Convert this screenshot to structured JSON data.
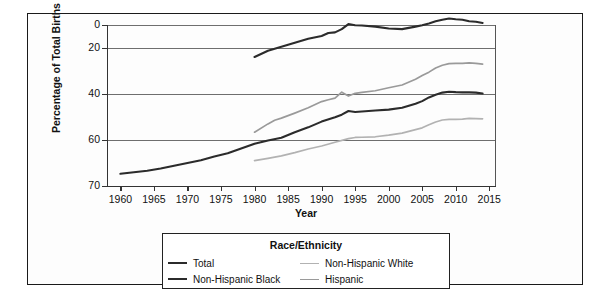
{
  "chart_data": {
    "type": "line",
    "title": "",
    "xlabel": "Year",
    "ylabel": "Percentage of Total Births",
    "xlim": [
      1958,
      2016
    ],
    "ylim": [
      0,
      70
    ],
    "xticks": [
      1960,
      1965,
      1970,
      1975,
      1980,
      1985,
      1990,
      1995,
      2000,
      2005,
      2010,
      2015
    ],
    "yticks": [
      0,
      20,
      40,
      60,
      70
    ],
    "grid": "horizontal",
    "legend_position": "below-center",
    "legend_title": "Race/Ethnicity",
    "series": [
      {
        "name": "Total",
        "color": "#2b2b2b",
        "width": 2.1,
        "x": [
          1960,
          1962,
          1964,
          1966,
          1968,
          1970,
          1972,
          1974,
          1976,
          1978,
          1980,
          1982,
          1984,
          1986,
          1988,
          1990,
          1992,
          1993,
          1994,
          1995,
          1996,
          1998,
          2000,
          2002,
          2004,
          2005,
          2006,
          2007,
          2008,
          2009,
          2010,
          2011,
          2012,
          2013,
          2014
        ],
        "values": [
          5.3,
          6.0,
          6.6,
          7.6,
          8.8,
          10.0,
          11.2,
          12.8,
          14.2,
          16.3,
          18.4,
          19.8,
          21.0,
          23.4,
          25.5,
          28.0,
          29.9,
          31.0,
          32.6,
          32.2,
          32.4,
          32.8,
          33.2,
          34.0,
          35.8,
          36.9,
          38.5,
          39.7,
          40.6,
          41.0,
          40.8,
          40.7,
          40.7,
          40.6,
          40.2
        ]
      },
      {
        "name": "Non-Hispanic Black",
        "color": "#2b2b2b",
        "width": 2.1,
        "x": [
          1980,
          1982,
          1984,
          1986,
          1988,
          1990,
          1991,
          1992,
          1993,
          1994,
          1995,
          1996,
          1998,
          2000,
          2002,
          2004,
          2005,
          2006,
          2007,
          2008,
          2009,
          2010,
          2011,
          2012,
          2013,
          2014
        ],
        "values": [
          56.1,
          58.8,
          60.5,
          62.3,
          64.0,
          65.2,
          66.5,
          66.8,
          68.2,
          70.4,
          69.9,
          69.8,
          69.3,
          68.5,
          68.2,
          69.3,
          69.9,
          70.7,
          71.6,
          72.3,
          72.8,
          72.5,
          72.3,
          71.6,
          71.4,
          70.9
        ]
      },
      {
        "name": "Non-Hispanic White",
        "color": "#b2b2b2",
        "width": 1.7,
        "x": [
          1980,
          1982,
          1984,
          1986,
          1988,
          1990,
          1992,
          1994,
          1995,
          1996,
          1998,
          2000,
          2002,
          2004,
          2005,
          2006,
          2007,
          2008,
          2009,
          2010,
          2011,
          2012,
          2013,
          2014
        ],
        "values": [
          11.0,
          12.0,
          13.1,
          14.5,
          16.1,
          17.4,
          19.0,
          20.6,
          21.1,
          21.2,
          21.4,
          22.1,
          23.0,
          24.5,
          25.3,
          26.6,
          27.8,
          28.7,
          29.0,
          29.0,
          29.1,
          29.4,
          29.3,
          29.2
        ]
      },
      {
        "name": "Hispanic",
        "color": "#9a9a9a",
        "width": 1.7,
        "x": [
          1980,
          1982,
          1983,
          1984,
          1986,
          1988,
          1990,
          1991,
          1992,
          1993,
          1994,
          1995,
          1996,
          1998,
          2000,
          2002,
          2004,
          2005,
          2006,
          2007,
          2008,
          2009,
          2010,
          2011,
          2012,
          2013,
          2014
        ],
        "values": [
          23.4,
          27.0,
          28.6,
          29.5,
          31.7,
          34.0,
          36.7,
          37.5,
          38.2,
          40.8,
          39.1,
          40.3,
          40.7,
          41.4,
          42.7,
          43.9,
          46.4,
          48.0,
          49.5,
          51.3,
          52.5,
          53.2,
          53.3,
          53.3,
          53.5,
          53.3,
          53.0
        ]
      }
    ]
  },
  "axes": {
    "ylabel": "Percentage of Total Births",
    "xlabel": "Year",
    "yticks": [
      "70",
      "60",
      "40",
      "20",
      "0"
    ],
    "xticks": [
      "1960",
      "1965",
      "1970",
      "1975",
      "1980",
      "1985",
      "1990",
      "1995",
      "2000",
      "2005",
      "2010",
      "2015"
    ]
  },
  "legend": {
    "title": "Race/Ethnicity",
    "items": [
      {
        "label": "Total",
        "color": "#2b2b2b",
        "width": "2.1px"
      },
      {
        "label": "Non-Hispanic White",
        "color": "#b2b2b2",
        "width": "1.7px"
      },
      {
        "label": "Non-Hispanic Black",
        "color": "#2b2b2b",
        "width": "2.1px"
      },
      {
        "label": "Hispanic",
        "color": "#9a9a9a",
        "width": "1.7px"
      }
    ]
  }
}
